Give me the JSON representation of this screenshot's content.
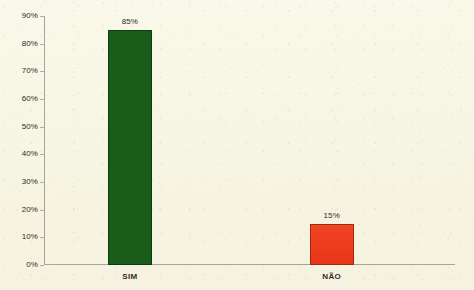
{
  "chart_data": {
    "type": "bar",
    "title": "",
    "subtitle": "",
    "xlabel": "",
    "ylabel": "",
    "categories": [
      "SIM",
      "NÃO"
    ],
    "values": [
      85,
      15
    ],
    "data_labels": [
      "85%",
      "15%"
    ],
    "series": [
      {
        "name": "",
        "values": [
          85,
          15
        ]
      }
    ],
    "ylim": [
      0,
      90
    ],
    "ytick_values": [
      0,
      10,
      20,
      30,
      40,
      50,
      60,
      70,
      80,
      90
    ],
    "ytick_labels": [
      "0%",
      "10%",
      "20%",
      "30%",
      "40%",
      "50%",
      "60%",
      "70%",
      "80%",
      "90%"
    ],
    "grid": false,
    "legend": false,
    "legend_position": "none",
    "annotations": [],
    "colors": {
      "background": "#f8f6e6",
      "axis": "#a9a596",
      "text": "#2b2b2b",
      "bar_sim_fill": "#1a5c1a",
      "bar_sim_border": "#0d3d0d",
      "bar_nao_fill": "#ee3b1f",
      "bar_nao_border": "#9e2a12"
    }
  }
}
